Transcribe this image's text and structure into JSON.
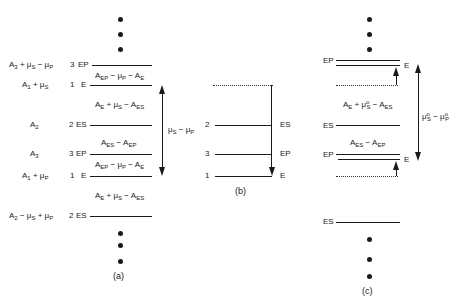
{
  "panel_a": {
    "caption": "(a)",
    "levels": [
      {
        "left_expr": "A₃ + μS − μP",
        "num": "3",
        "state": "EP"
      },
      {
        "left_expr": "A₁ + μS",
        "num": "1",
        "state": "E"
      },
      {
        "left_expr": "A₂",
        "num": "2",
        "state": "ES"
      },
      {
        "left_expr": "A₃",
        "num": "3",
        "state": "EP"
      },
      {
        "left_expr": "A₁ + μP",
        "num": "1",
        "state": "E"
      },
      {
        "left_expr": "A₂ − μS + μP",
        "num": "2",
        "state": "ES"
      }
    ],
    "gaps": [
      "AEP − μP − AE",
      "AE + μS − AES",
      "AES − AEP",
      "AEP − μP − AE",
      "AE + μS − AES"
    ],
    "arrow_label": "μS − μP"
  },
  "panel_b": {
    "caption": "(b)",
    "levels": [
      {
        "num": "2",
        "state": "ES"
      },
      {
        "num": "3",
        "state": "EP"
      },
      {
        "num": "1",
        "state": "E"
      }
    ]
  },
  "panel_c": {
    "caption": "(c)",
    "levels": [
      {
        "state": "EP"
      },
      {
        "state": "E"
      },
      {
        "state": "ES"
      },
      {
        "state": "EP"
      },
      {
        "state": "E"
      },
      {
        "state": "ES"
      }
    ],
    "gaps": [
      "AE + μ°S − AES",
      "AES − AEP"
    ],
    "arrow_label": "μ°S − μ°P"
  }
}
